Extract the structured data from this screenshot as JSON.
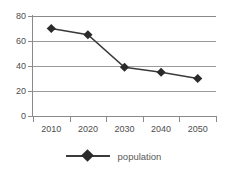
{
  "chart_data": {
    "type": "line",
    "title": "",
    "xlabel": "",
    "ylabel": "",
    "categories": [
      "2010",
      "2020",
      "2030",
      "2040",
      "2050"
    ],
    "series": [
      {
        "name": "population",
        "values": [
          70,
          65,
          39,
          35,
          30
        ]
      }
    ],
    "ylim": [
      0,
      80
    ],
    "yticks": [
      0,
      20,
      40,
      60,
      80
    ],
    "ytick_labels": [
      "0",
      "20",
      "40",
      "60",
      "80"
    ],
    "grid": true,
    "legend_position": "bottom-center",
    "colors": {
      "line": "#3a3a3a",
      "marker": "#2b2b2b",
      "gridline": "#9a9a9a",
      "axis": "#8a8a8a",
      "tick_text": "#4d4d4d",
      "legend_text": "#595959",
      "background": "#ffffff"
    },
    "marker": "diamond"
  },
  "legend": {
    "items": [
      {
        "label": "population",
        "marker": "diamond-marker-icon"
      }
    ]
  }
}
